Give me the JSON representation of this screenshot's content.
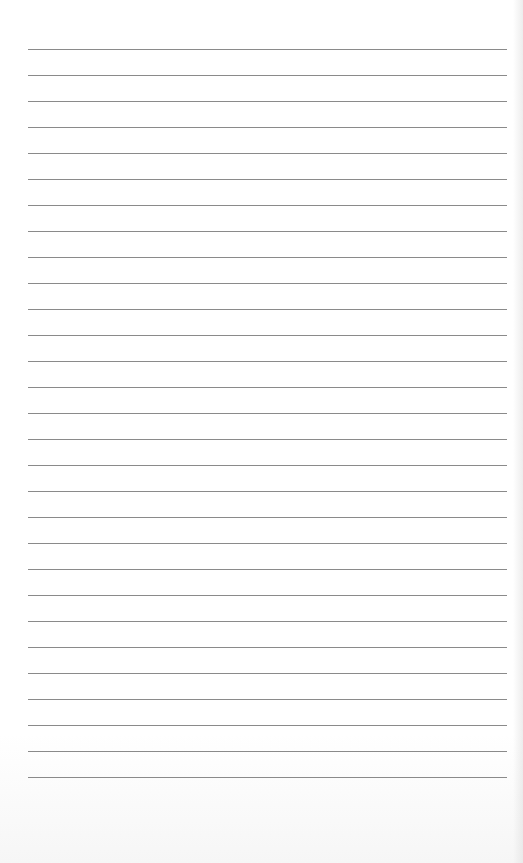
{
  "paper": {
    "type": "lined",
    "line_count": 29,
    "first_line_y": 49,
    "line_spacing": 26,
    "line_left": 28,
    "line_width": 479,
    "line_color": "#8a8a8a",
    "background_color": "#ffffff"
  }
}
